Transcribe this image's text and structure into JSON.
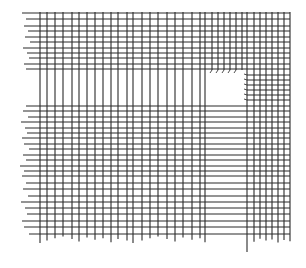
{
  "drawing": {
    "description": "Hand-drawn style grid of crossing horizontal and vertical lines with a horizontal gap band and a notch in the upper right",
    "stroke_color": "#2a2a2a",
    "background": "#ffffff",
    "vertical_lines": {
      "left_block_x": [
        40,
        47,
        55,
        63,
        72,
        79,
        87,
        95,
        103,
        111,
        118,
        127,
        133,
        142,
        150,
        158,
        167,
        175,
        183,
        192,
        200,
        205
      ],
      "right_block_x": [
        247,
        254,
        260,
        266,
        272,
        278,
        284,
        290
      ],
      "top_y": 12,
      "bottom_y": 243
    },
    "horizontal_lines": {
      "upper_band_y": [
        13,
        19,
        26,
        31,
        37,
        42,
        48,
        53,
        58,
        64,
        69
      ],
      "lower_band_y": [
        106,
        111,
        117,
        122,
        128,
        133,
        138,
        144,
        149,
        155,
        160,
        166,
        171,
        176,
        183,
        189,
        196,
        202,
        208,
        214,
        221,
        227,
        234
      ],
      "notch_right_y": [
        75,
        80,
        85,
        90,
        95,
        100
      ],
      "left_x": 20,
      "right_x": 290
    },
    "notch": {
      "x": 205,
      "y": 70,
      "width": 42,
      "height": 35
    }
  }
}
